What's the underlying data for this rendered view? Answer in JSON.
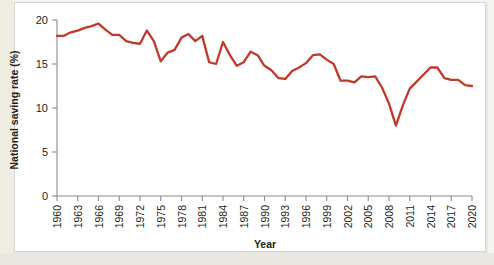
{
  "chart_data": {
    "type": "line",
    "title": "",
    "xlabel": "Year",
    "ylabel": "National saving rate (%)",
    "xlim": [
      1960,
      2020
    ],
    "ylim": [
      0,
      20
    ],
    "yticks": [
      0,
      5,
      10,
      15,
      20
    ],
    "ytick_labels": [
      "0",
      "5",
      "10",
      "15",
      "20"
    ],
    "xticks": [
      1960,
      1963,
      1966,
      1969,
      1972,
      1975,
      1978,
      1981,
      1984,
      1987,
      1990,
      1993,
      1996,
      1999,
      2002,
      2005,
      2008,
      2011,
      2014,
      2017,
      2020
    ],
    "xtick_labels": [
      "1960",
      "1963",
      "1966",
      "1969",
      "1972",
      "1975",
      "1978",
      "1981",
      "1984",
      "1987",
      "1990",
      "1993",
      "1996",
      "1999",
      "2002",
      "2005",
      "2008",
      "2011",
      "2014",
      "2017",
      "2020"
    ],
    "grid": false,
    "legend": false,
    "series": [
      {
        "name": "National saving rate",
        "color": "#c0392b",
        "x": [
          1960,
          1961,
          1962,
          1963,
          1964,
          1965,
          1966,
          1967,
          1968,
          1969,
          1970,
          1971,
          1972,
          1973,
          1974,
          1975,
          1976,
          1977,
          1978,
          1979,
          1980,
          1981,
          1982,
          1983,
          1984,
          1985,
          1986,
          1987,
          1988,
          1989,
          1990,
          1991,
          1992,
          1993,
          1994,
          1995,
          1996,
          1997,
          1998,
          1999,
          2000,
          2001,
          2002,
          2003,
          2004,
          2005,
          2006,
          2007,
          2008,
          2009,
          2010,
          2011,
          2012,
          2013,
          2014,
          2015,
          2016,
          2017,
          2018,
          2019,
          2020
        ],
        "values": [
          18.2,
          18.2,
          18.6,
          18.8,
          19.1,
          19.3,
          19.6,
          18.9,
          18.3,
          18.3,
          17.6,
          17.4,
          17.3,
          18.8,
          17.6,
          15.3,
          16.3,
          16.6,
          18.0,
          18.4,
          17.6,
          18.2,
          15.2,
          15.0,
          17.5,
          16.0,
          14.8,
          15.2,
          16.4,
          16.0,
          14.8,
          14.3,
          13.4,
          13.3,
          14.2,
          14.6,
          15.1,
          16.0,
          16.1,
          15.5,
          15.0,
          13.1,
          13.1,
          12.9,
          13.6,
          13.5,
          13.6,
          12.3,
          10.5,
          8.0,
          10.3,
          12.2,
          13.0,
          13.8,
          14.6,
          14.6,
          13.4,
          13.2,
          13.2,
          12.6,
          12.5
        ]
      }
    ]
  },
  "figure": {
    "background_color": "#f6f4ee",
    "plot_background_color": "#ffffff",
    "accent_color": "#c0392b"
  }
}
